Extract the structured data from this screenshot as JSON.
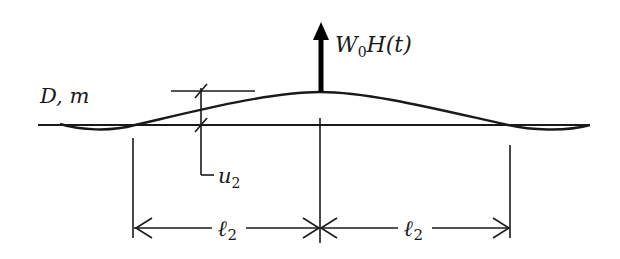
{
  "diagram": {
    "type": "beam-deflection",
    "labels": {
      "beam_properties": "D, m",
      "load_main": "W",
      "load_sub": "0",
      "load_func": "H(t)",
      "displacement_main": "u",
      "displacement_sub": "2",
      "span_left_main": "ℓ",
      "span_left_sub": "2",
      "span_right_main": "ℓ",
      "span_right_sub": "2"
    },
    "colors": {
      "stroke": "#1a1a1a",
      "background": "#ffffff"
    }
  }
}
